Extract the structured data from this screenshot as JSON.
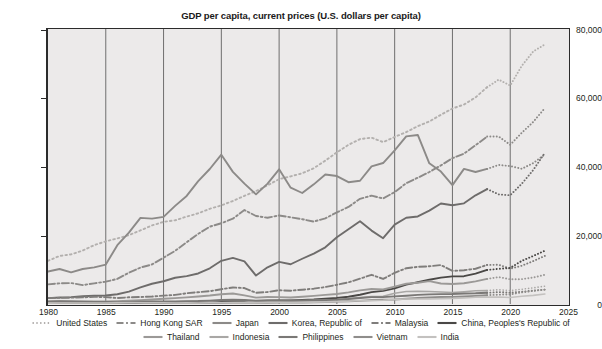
{
  "chart_data": {
    "type": "line",
    "title": "GDP per capita, current prices (U.S. dollars per capita)",
    "xlabel": "",
    "ylabel": "",
    "xlim": [
      1980,
      2025
    ],
    "ylim": [
      0,
      80000
    ],
    "grid": "vertical",
    "legend_position": "bottom",
    "x_ticks": [
      "1980",
      "1985",
      "1990",
      "1995",
      "2000",
      "2005",
      "2010",
      "2015",
      "2020",
      "2025"
    ],
    "y_ticks": [
      "0",
      "20,000",
      "40,000",
      "60,000",
      "80,000"
    ],
    "x": [
      1980,
      1981,
      1982,
      1983,
      1984,
      1985,
      1986,
      1987,
      1988,
      1989,
      1990,
      1991,
      1992,
      1993,
      1994,
      1995,
      1996,
      1997,
      1998,
      1999,
      2000,
      2001,
      2002,
      2003,
      2004,
      2005,
      2006,
      2007,
      2008,
      2009,
      2010,
      2011,
      2012,
      2013,
      2014,
      2015,
      2016,
      2017,
      2018,
      2019,
      2020,
      2021,
      2022,
      2023
    ],
    "forecast_start_year": 2018,
    "series": [
      {
        "name": "United States",
        "style": "dotted",
        "color": "#b3b0ae",
        "values": [
          12575,
          13976,
          14434,
          15544,
          17121,
          18237,
          19071,
          20039,
          21417,
          22857,
          23889,
          24342,
          25419,
          26387,
          27695,
          28691,
          29968,
          31459,
          32854,
          34515,
          36330,
          37134,
          38023,
          39496,
          41713,
          44115,
          46299,
          47976,
          48383,
          47100,
          48586,
          50008,
          51737,
          53107,
          55050,
          56863,
          58021,
          60110,
          63064,
          65280,
          63544,
          69288,
          73500,
          75500
        ],
        "forecast_from": 2018
      },
      {
        "name": "Hong Kong SAR",
        "style": "dashdot",
        "color": "#8c8a88",
        "values": [
          5700,
          6000,
          6100,
          5500,
          6000,
          6500,
          7300,
          9100,
          10600,
          11500,
          13486,
          15466,
          17976,
          20395,
          22502,
          23497,
          24818,
          27330,
          25600,
          25096,
          25757,
          25225,
          24665,
          23977,
          24928,
          26650,
          28224,
          30594,
          31516,
          30697,
          32550,
          35142,
          36731,
          38404,
          40316,
          42432,
          43731,
          46194,
          48713,
          48713,
          46324,
          49800,
          53000,
          57000
        ],
        "forecast_from": 2018
      },
      {
        "name": "Japan",
        "style": "solid",
        "color": "#8c8a88",
        "values": [
          9465,
          10182,
          9223,
          10180,
          10655,
          11465,
          17112,
          20750,
          25056,
          24830,
          25359,
          28541,
          31439,
          35766,
          39266,
          43440,
          38436,
          35022,
          31902,
          35022,
          39169,
          33846,
          32289,
          34808,
          37688,
          37218,
          35434,
          35847,
          40058,
          41013,
          44674,
          48760,
          49175,
          40935,
          38522,
          34568,
          39306,
          38387,
          39290,
          40458,
          40113,
          39340,
          41000,
          43500
        ],
        "forecast_from": 2018
      },
      {
        "name": "Korea, Republic of",
        "style": "solid",
        "color": "#6e6c6b",
        "values": [
          1715,
          1883,
          2010,
          2242,
          2420,
          2482,
          2835,
          3602,
          4832,
          5883,
          6610,
          7637,
          8126,
          8885,
          10385,
          12565,
          13404,
          12398,
          8282,
          10672,
          12257,
          11561,
          13165,
          14673,
          16496,
          19403,
          21743,
          24086,
          21350,
          19143,
          23087,
          25096,
          25467,
          27179,
          29249,
          28732,
          29289,
          31617,
          33423,
          31902,
          31638,
          34983,
          39000,
          44000
        ],
        "forecast_from": 2018
      },
      {
        "name": "Malaysia",
        "style": "dashdot",
        "color": "#7f7d7b",
        "values": [
          1775,
          1769,
          1841,
          1923,
          2087,
          2000,
          1728,
          1943,
          2044,
          2170,
          2442,
          2654,
          3127,
          3430,
          3725,
          4297,
          4797,
          4637,
          3250,
          3492,
          4005,
          3876,
          4164,
          4458,
          4930,
          5587,
          6301,
          7373,
          8493,
          7292,
          9071,
          10399,
          10817,
          10970,
          11319,
          9649,
          9818,
          10259,
          11373,
          11415,
          10270,
          11125,
          12500,
          14000
        ],
        "forecast_from": 2018
      },
      {
        "name": "China, Peoples's Republic of",
        "style": "solid",
        "color": "#4a4846",
        "values": [
          195,
          197,
          203,
          225,
          250,
          294,
          282,
          252,
          284,
          311,
          317,
          333,
          366,
          377,
          473,
          609,
          709,
          781,
          828,
          873,
          959,
          1053,
          1148,
          1288,
          1508,
          1753,
          2099,
          2694,
          3468,
          3832,
          4550,
          5618,
          6317,
          7051,
          7679,
          8034,
          8094,
          8817,
          9905,
          10216,
          10500,
          12556,
          14000,
          15500
        ],
        "forecast_from": 2018
      },
      {
        "name": "Thailand",
        "style": "solid",
        "color": "#9b9997",
        "values": [
          683,
          727,
          727,
          773,
          771,
          749,
          811,
          932,
          1122,
          1294,
          1509,
          1701,
          1926,
          2187,
          2473,
          2847,
          3044,
          2497,
          1843,
          2029,
          2008,
          1893,
          2095,
          2358,
          2649,
          2894,
          3370,
          3973,
          4375,
          4217,
          5076,
          5894,
          6169,
          6656,
          5950,
          5840,
          6043,
          6595,
          7296,
          7817,
          7189,
          7233,
          7700,
          8500
        ],
        "forecast_from": 2018
      },
      {
        "name": "Indonesia",
        "style": "solid",
        "color": "#a9a7a5",
        "values": [
          673,
          724,
          690,
          558,
          563,
          562,
          517,
          468,
          502,
          560,
          622,
          676,
          726,
          835,
          920,
          1026,
          1137,
          1064,
          463,
          668,
          780,
          748,
          900,
          1066,
          1151,
          1262,
          1586,
          1855,
          2167,
          2260,
          3122,
          3634,
          3694,
          3624,
          3492,
          3331,
          3563,
          3837,
          3894,
          4136,
          3912,
          4292,
          4700,
          5200
        ],
        "forecast_from": 2018
      },
      {
        "name": "Philippines",
        "style": "solid",
        "color": "#7a7876",
        "values": [
          741,
          785,
          772,
          690,
          615,
          571,
          542,
          581,
          655,
          716,
          730,
          729,
          839,
          854,
          983,
          1151,
          1248,
          1171,
          942,
          1078,
          1073,
          1003,
          1027,
          1046,
          1115,
          1244,
          1447,
          1755,
          1991,
          1987,
          2218,
          2406,
          2645,
          2792,
          2869,
          2927,
          3073,
          3123,
          3252,
          3485,
          3299,
          3572,
          3900,
          4200
        ],
        "forecast_from": 2018
      },
      {
        "name": "Vietnam",
        "style": "solid",
        "color": "#8f8d8b",
        "values": [
          99,
          108,
          118,
          143,
          166,
          227,
          427,
          513,
          381,
          96,
          95,
          139,
          144,
          182,
          228,
          277,
          337,
          361,
          361,
          374,
          390,
          405,
          430,
          478,
          546,
          687,
          784,
          906,
          1149,
          1217,
          1318,
          1525,
          1735,
          1886,
          2030,
          2065,
          2192,
          2366,
          2566,
          2715,
          2786,
          3373,
          3800,
          4200
        ],
        "forecast_from": 2018
      },
      {
        "name": "India",
        "style": "solid",
        "color": "#c3c1bf",
        "values": [
          267,
          271,
          276,
          291,
          277,
          306,
          320,
          349,
          375,
          363,
          369,
          304,
          320,
          301,
          347,
          373,
          400,
          413,
          413,
          440,
          443,
          451,
          473,
          545,
          627,
          714,
          807,
          1028,
          991,
          1090,
          1341,
          1446,
          1434,
          1438,
          1560,
          1606,
          1732,
          1981,
          1997,
          2050,
          1900,
          2250,
          2500,
          2900
        ]
      }
    ]
  },
  "legend": {
    "rows": [
      [
        {
          "label": "United States",
          "style": "dotted",
          "color": "#b3b0ae"
        },
        {
          "label": "Hong Kong SAR",
          "style": "dashdot",
          "color": "#8c8a88"
        },
        {
          "label": "Japan",
          "style": "solid",
          "color": "#8c8a88"
        },
        {
          "label": "Korea, Republic of",
          "style": "solid",
          "color": "#6e6c6b"
        },
        {
          "label": "Malaysia",
          "style": "dashdot",
          "color": "#7f7d7b"
        },
        {
          "label": "China, Peoples's Republic of",
          "style": "solid",
          "color": "#4a4846"
        }
      ],
      [
        {
          "label": "Thailand",
          "style": "solid",
          "color": "#9b9997"
        },
        {
          "label": "Indonesia",
          "style": "solid",
          "color": "#a9a7a5"
        },
        {
          "label": "Philippines",
          "style": "solid",
          "color": "#7a7876"
        },
        {
          "label": "Vietnam",
          "style": "solid",
          "color": "#8f8d8b"
        },
        {
          "label": "India",
          "style": "solid",
          "color": "#c3c1bf"
        }
      ]
    ]
  },
  "colors": {
    "plot_background": "#eceaea",
    "frame": "#2b2b2b",
    "gridline": "#3a3a3a",
    "text": "#231f20",
    "page_background": "#ffffff"
  }
}
